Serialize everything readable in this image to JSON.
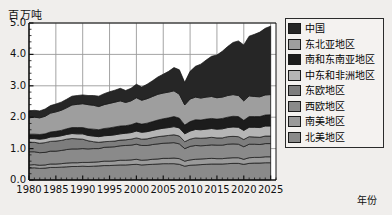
{
  "chart_data": {
    "type": "area",
    "stacked": true,
    "title": "",
    "ylabel": "百万吨",
    "xlabel": "年份",
    "ylim": [
      0.0,
      5.0
    ],
    "xlim": [
      1980,
      2026
    ],
    "grid": true,
    "legend_position": "right",
    "ytick_labels": [
      "0.0",
      "1.0",
      "2.0",
      "3.0",
      "4.0",
      "5.0"
    ],
    "ytick_values": [
      0.0,
      1.0,
      2.0,
      3.0,
      4.0,
      5.0
    ],
    "xtick_labels": [
      "1980",
      "1985",
      "1990",
      "1995",
      "2000",
      "2005",
      "2010",
      "2015",
      "2020",
      "2025"
    ],
    "xtick_values": [
      1980,
      1985,
      1990,
      1995,
      2000,
      2005,
      2010,
      2015,
      2020,
      2025
    ],
    "x": [
      1980,
      1981,
      1982,
      1983,
      1984,
      1985,
      1986,
      1987,
      1988,
      1989,
      1990,
      1991,
      1992,
      1993,
      1994,
      1995,
      1996,
      1997,
      1998,
      1999,
      2000,
      2001,
      2002,
      2003,
      2004,
      2005,
      2006,
      2007,
      2008,
      2009,
      2010,
      2011,
      2012,
      2013,
      2014,
      2015,
      2016,
      2017,
      2018,
      2019,
      2020,
      2021,
      2022,
      2023,
      2024,
      2025
    ],
    "series": [
      {
        "name": "北美地区",
        "color": "#8a8a8a",
        "stack_order": 1,
        "values": [
          0.38,
          0.39,
          0.37,
          0.38,
          0.4,
          0.4,
          0.41,
          0.42,
          0.43,
          0.43,
          0.44,
          0.43,
          0.44,
          0.45,
          0.46,
          0.46,
          0.47,
          0.48,
          0.48,
          0.49,
          0.5,
          0.48,
          0.49,
          0.5,
          0.51,
          0.52,
          0.52,
          0.52,
          0.5,
          0.44,
          0.47,
          0.48,
          0.49,
          0.5,
          0.51,
          0.51,
          0.51,
          0.52,
          0.53,
          0.53,
          0.5,
          0.53,
          0.54,
          0.54,
          0.55,
          0.55
        ]
      },
      {
        "name": "南美地区",
        "color": "#9a9a9a",
        "stack_order": 2,
        "values": [
          0.1,
          0.1,
          0.1,
          0.1,
          0.11,
          0.11,
          0.11,
          0.12,
          0.12,
          0.12,
          0.12,
          0.13,
          0.13,
          0.13,
          0.14,
          0.14,
          0.14,
          0.15,
          0.15,
          0.15,
          0.16,
          0.15,
          0.15,
          0.16,
          0.16,
          0.17,
          0.17,
          0.18,
          0.18,
          0.16,
          0.17,
          0.18,
          0.18,
          0.18,
          0.18,
          0.17,
          0.17,
          0.18,
          0.18,
          0.18,
          0.16,
          0.18,
          0.18,
          0.18,
          0.19,
          0.19
        ]
      },
      {
        "name": "西欧地区",
        "color": "#8a8a8a",
        "stack_order": 3,
        "values": [
          0.42,
          0.41,
          0.4,
          0.4,
          0.41,
          0.41,
          0.42,
          0.43,
          0.44,
          0.44,
          0.44,
          0.43,
          0.43,
          0.42,
          0.44,
          0.45,
          0.45,
          0.46,
          0.47,
          0.47,
          0.48,
          0.47,
          0.46,
          0.47,
          0.48,
          0.48,
          0.49,
          0.49,
          0.47,
          0.4,
          0.43,
          0.44,
          0.42,
          0.42,
          0.43,
          0.43,
          0.43,
          0.44,
          0.44,
          0.43,
          0.4,
          0.43,
          0.42,
          0.41,
          0.42,
          0.42
        ]
      },
      {
        "name": "东欧地区",
        "color": "#7d7d7d",
        "stack_order": 4,
        "values": [
          0.3,
          0.3,
          0.3,
          0.31,
          0.31,
          0.32,
          0.32,
          0.33,
          0.33,
          0.32,
          0.3,
          0.26,
          0.22,
          0.2,
          0.18,
          0.18,
          0.18,
          0.18,
          0.18,
          0.19,
          0.2,
          0.2,
          0.21,
          0.22,
          0.23,
          0.23,
          0.24,
          0.25,
          0.25,
          0.22,
          0.23,
          0.24,
          0.24,
          0.24,
          0.24,
          0.23,
          0.23,
          0.24,
          0.24,
          0.24,
          0.23,
          0.24,
          0.23,
          0.23,
          0.24,
          0.24
        ]
      },
      {
        "name": "中东和非洲地区",
        "color": "#b5b5b5",
        "stack_order": 5,
        "values": [
          0.12,
          0.12,
          0.13,
          0.13,
          0.14,
          0.14,
          0.15,
          0.15,
          0.16,
          0.16,
          0.17,
          0.17,
          0.18,
          0.18,
          0.19,
          0.19,
          0.2,
          0.2,
          0.21,
          0.21,
          0.22,
          0.22,
          0.23,
          0.23,
          0.24,
          0.25,
          0.25,
          0.26,
          0.26,
          0.25,
          0.26,
          0.27,
          0.27,
          0.28,
          0.28,
          0.28,
          0.29,
          0.29,
          0.3,
          0.3,
          0.29,
          0.3,
          0.31,
          0.31,
          0.32,
          0.32
        ]
      },
      {
        "name": "南和东南亚地区",
        "color": "#1c1c1c",
        "stack_order": 6,
        "values": [
          0.14,
          0.14,
          0.15,
          0.15,
          0.16,
          0.17,
          0.17,
          0.18,
          0.19,
          0.2,
          0.2,
          0.21,
          0.22,
          0.22,
          0.23,
          0.24,
          0.25,
          0.25,
          0.24,
          0.25,
          0.26,
          0.26,
          0.27,
          0.28,
          0.29,
          0.3,
          0.31,
          0.32,
          0.31,
          0.28,
          0.3,
          0.31,
          0.31,
          0.32,
          0.32,
          0.32,
          0.33,
          0.33,
          0.34,
          0.34,
          0.32,
          0.34,
          0.34,
          0.35,
          0.35,
          0.36
        ]
      },
      {
        "name": "东北亚地区",
        "color": "#9e9e9e",
        "stack_order": 7,
        "values": [
          0.52,
          0.54,
          0.53,
          0.56,
          0.6,
          0.62,
          0.64,
          0.67,
          0.72,
          0.74,
          0.76,
          0.77,
          0.76,
          0.74,
          0.76,
          0.78,
          0.79,
          0.8,
          0.74,
          0.76,
          0.8,
          0.76,
          0.78,
          0.8,
          0.82,
          0.82,
          0.82,
          0.82,
          0.76,
          0.64,
          0.72,
          0.72,
          0.7,
          0.7,
          0.7,
          0.68,
          0.68,
          0.69,
          0.69,
          0.67,
          0.62,
          0.66,
          0.64,
          0.63,
          0.64,
          0.64
        ]
      },
      {
        "name": "中国",
        "color": "#262626",
        "stack_order": 8,
        "values": [
          0.22,
          0.22,
          0.22,
          0.23,
          0.24,
          0.25,
          0.26,
          0.27,
          0.28,
          0.28,
          0.28,
          0.29,
          0.31,
          0.33,
          0.35,
          0.37,
          0.38,
          0.4,
          0.38,
          0.4,
          0.43,
          0.42,
          0.46,
          0.5,
          0.55,
          0.6,
          0.66,
          0.74,
          0.78,
          0.72,
          0.88,
          0.98,
          1.08,
          1.18,
          1.28,
          1.36,
          1.46,
          1.56,
          1.66,
          1.74,
          1.78,
          1.9,
          1.98,
          2.06,
          2.12,
          2.18
        ]
      }
    ],
    "totals_note": "2025 年合计约 4.7 百万吨"
  },
  "legend": {
    "items": [
      {
        "label": "中国",
        "color": "#262626"
      },
      {
        "label": "东北亚地区",
        "color": "#9e9e9e"
      },
      {
        "label": "南和东南亚地区",
        "color": "#1c1c1c"
      },
      {
        "label": "中东和非洲地区",
        "color": "#b5b5b5"
      },
      {
        "label": "东欧地区",
        "color": "#7d7d7d"
      },
      {
        "label": "西欧地区",
        "color": "#8a8a8a"
      },
      {
        "label": "南美地区",
        "color": "#9a9a9a"
      },
      {
        "label": "北美地区",
        "color": "#8a8a8a"
      }
    ]
  },
  "axes": {
    "y_unit_label": "百万吨",
    "x_unit_label": "年份"
  }
}
